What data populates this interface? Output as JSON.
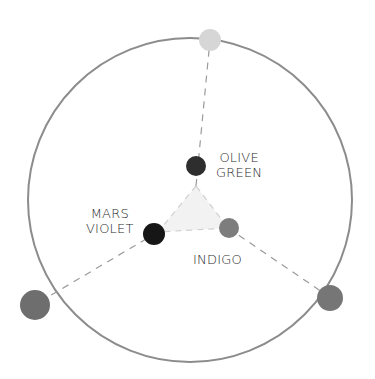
{
  "diagram": {
    "type": "color-mixing-wheel",
    "outer_circle": {
      "cx": 190,
      "cy": 200,
      "r": 162,
      "stroke": "#8c8c8c"
    },
    "inner_triangle": {
      "points": [
        [
          196,
          186
        ],
        [
          158,
          232
        ],
        [
          228,
          228
        ]
      ],
      "fill": "#f2f2f2"
    },
    "spokes": [
      {
        "from": [
          196,
          186
        ],
        "to": [
          210,
          40
        ]
      },
      {
        "from": [
          158,
          232
        ],
        "to": [
          36,
          304
        ]
      },
      {
        "from": [
          228,
          228
        ],
        "to": [
          328,
          296
        ]
      }
    ],
    "inner_dots": [
      {
        "name": "olive-green",
        "cx": 196,
        "cy": 166,
        "r": 10,
        "color": "#2e2e2e"
      },
      {
        "name": "mars-violet",
        "cx": 154,
        "cy": 234,
        "r": 11,
        "color": "#151515"
      },
      {
        "name": "indigo",
        "cx": 229,
        "cy": 228,
        "r": 10,
        "color": "#7d7d7d"
      }
    ],
    "outer_dots": [
      {
        "name": "top",
        "cx": 210,
        "cy": 40,
        "r": 11,
        "color": "#d6d6d6"
      },
      {
        "name": "bottom-left",
        "cx": 35,
        "cy": 305,
        "r": 15,
        "color": "#6e6e6e"
      },
      {
        "name": "bottom-right",
        "cx": 330,
        "cy": 298,
        "r": 13,
        "color": "#767676"
      }
    ]
  },
  "labels": {
    "olive_green": {
      "line1": "OLIVE",
      "line2": "GREEN"
    },
    "mars_violet": {
      "line1": "MARS",
      "line2": "VIOLET"
    },
    "indigo": {
      "line1": "INDIGO"
    }
  }
}
